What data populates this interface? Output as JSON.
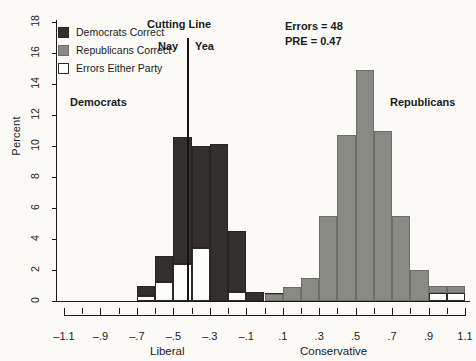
{
  "chart_data": {
    "type": "bar",
    "title": "",
    "subtitle": "",
    "xlabel": "",
    "ylabel": "Percent",
    "xlim": [
      -1.1,
      1.1
    ],
    "ylim": [
      0,
      18
    ],
    "ytick_step": 2,
    "xtick_step": 0.2,
    "xtick_minor_step": 0.1,
    "grid": false,
    "bin_width": 0.1,
    "legend_position": "upper-left",
    "xaxis_end_labels": {
      "left": "Liberal",
      "right": "Conservative"
    },
    "xticks": [
      "-1.1",
      "-.9",
      "-.7",
      "-.5",
      "-.3",
      "-.1",
      ".1",
      ".3",
      ".5",
      ".7",
      ".9",
      "1.1"
    ],
    "xtick_values": [
      -1.1,
      -0.9,
      -0.7,
      -0.5,
      -0.3,
      -0.1,
      0.1,
      0.3,
      0.5,
      0.7,
      0.9,
      1.1
    ],
    "yticks": [
      "0",
      "2",
      "4",
      "6",
      "8",
      "10",
      "12",
      "14",
      "16",
      "18"
    ],
    "ytick_values": [
      0,
      2,
      4,
      6,
      8,
      10,
      12,
      14,
      16,
      18
    ],
    "series": [
      {
        "name": "Democrats Correct",
        "color": "#332f2c",
        "bins": [
          {
            "x0": -0.7,
            "x1": -0.6,
            "value": 1.0
          },
          {
            "x0": -0.6,
            "x1": -0.5,
            "value": 2.9
          },
          {
            "x0": -0.5,
            "x1": -0.4,
            "value": 10.6
          },
          {
            "x0": -0.4,
            "x1": -0.3,
            "value": 10.0
          },
          {
            "x0": -0.3,
            "x1": -0.2,
            "value": 10.1
          },
          {
            "x0": -0.2,
            "x1": -0.1,
            "value": 4.5
          },
          {
            "x0": -0.1,
            "x1": 0.0,
            "value": 0.55
          },
          {
            "x0": 0.0,
            "x1": 0.1,
            "value": 0.5
          },
          {
            "x0": 0.1,
            "x1": 0.2,
            "value": 0.45
          }
        ]
      },
      {
        "name": "Republicans Correct",
        "color": "#8a8a84",
        "bins": [
          {
            "x0": 0.0,
            "x1": 0.1,
            "value": 0.45
          },
          {
            "x0": 0.1,
            "x1": 0.2,
            "value": 0.9
          },
          {
            "x0": 0.2,
            "x1": 0.3,
            "value": 1.5
          },
          {
            "x0": 0.3,
            "x1": 0.4,
            "value": 5.5
          },
          {
            "x0": 0.4,
            "x1": 0.5,
            "value": 10.7
          },
          {
            "x0": 0.5,
            "x1": 0.6,
            "value": 14.9
          },
          {
            "x0": 0.6,
            "x1": 0.7,
            "value": 11.0
          },
          {
            "x0": 0.7,
            "x1": 0.8,
            "value": 5.5
          },
          {
            "x0": 0.8,
            "x1": 0.9,
            "value": 2.0
          },
          {
            "x0": 0.9,
            "x1": 1.0,
            "value": 0.5
          },
          {
            "x0": 1.0,
            "x1": 1.1,
            "value": 0.5
          }
        ]
      },
      {
        "name": "Errors Either Party",
        "color": "#fdfdfb",
        "bins": [
          {
            "x0": -0.7,
            "x1": -0.6,
            "value": 0.35
          },
          {
            "x0": -0.6,
            "x1": -0.5,
            "value": 1.2
          },
          {
            "x0": -0.5,
            "x1": -0.4,
            "value": 2.4
          },
          {
            "x0": -0.4,
            "x1": -0.3,
            "value": 3.4
          },
          {
            "x0": -0.3,
            "x1": -0.2,
            "value": 0.0
          },
          {
            "x0": -0.2,
            "x1": -0.1,
            "value": 0.6
          },
          {
            "x0": 0.9,
            "x1": 1.0,
            "value": 0.5
          },
          {
            "x0": 1.0,
            "x1": 1.1,
            "value": 0.5
          }
        ]
      }
    ],
    "annotations": [
      {
        "name": "cutting-line",
        "label": "Cutting Line",
        "x": -0.35
      },
      {
        "name": "nay-label",
        "label": "Nay"
      },
      {
        "name": "yea-label",
        "label": "Yea"
      },
      {
        "name": "democrats-label",
        "label": "Democrats"
      },
      {
        "name": "republicans-label",
        "label": "Republicans"
      },
      {
        "name": "errors-stat",
        "label": "Errors = 48"
      },
      {
        "name": "pre-stat",
        "label": "PRE = 0.47"
      }
    ]
  },
  "legend": {
    "items": [
      {
        "label": "Democrats Correct",
        "swatch": "dem"
      },
      {
        "label": "Republicans Correct",
        "swatch": "rep"
      },
      {
        "label": "Errors Either Party",
        "swatch": "err"
      }
    ]
  },
  "labels": {
    "ylabel": "Percent",
    "liberal": "Liberal",
    "conservative": "Conservative",
    "cutting_line": "Cutting Line",
    "nay": "Nay",
    "yea": "Yea",
    "democrats": "Democrats",
    "republicans": "Republicans",
    "errors": "Errors = 48",
    "pre": "PRE = 0.47"
  },
  "colors": {
    "democrat_fill": "#332f2c",
    "republican_fill": "#8a8a84",
    "error_fill": "#fdfdfb",
    "axis": "#1a1a1a",
    "background": "#fbfaf7"
  }
}
